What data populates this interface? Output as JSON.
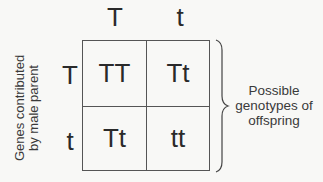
{
  "diagram": {
    "type": "punnett-square",
    "column_alleles": [
      "T",
      "t"
    ],
    "row_alleles": [
      "T",
      "t"
    ],
    "row_axis_label": [
      "Genes contributed",
      "by male parent"
    ],
    "cells": [
      [
        "TT",
        "Tt"
      ],
      [
        "Tt",
        "tt"
      ]
    ],
    "brace_label": [
      "Possible",
      "genotypes of",
      "offspring"
    ]
  }
}
